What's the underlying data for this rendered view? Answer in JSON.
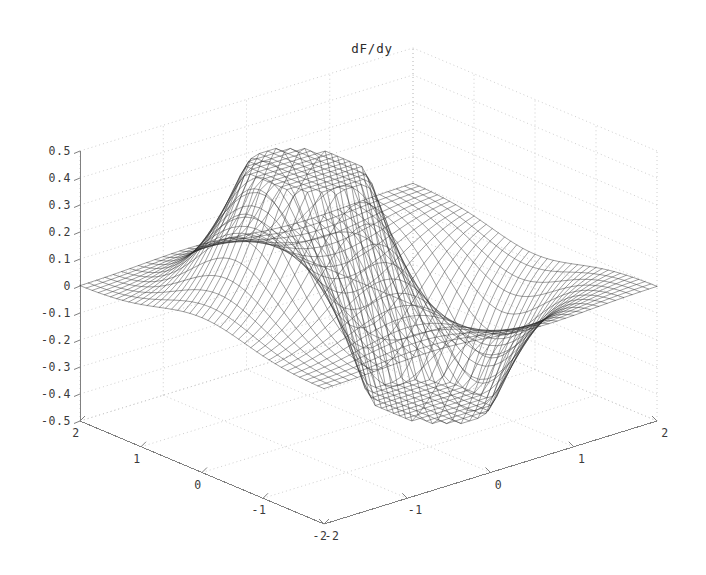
{
  "figure": {
    "title": "dF/dy",
    "background_color": "#ffffff",
    "mesh_color": "#2b2b2b",
    "axis_color": "#808080",
    "grid_color": "#c8c8c8",
    "label_color": "#3a3a3a"
  },
  "chart_data": {
    "type": "surface",
    "render_style": "wireframe-mesh",
    "title": "dF/dy",
    "xlabel": "",
    "ylabel": "",
    "zlabel": "",
    "xlim": [
      -2,
      2
    ],
    "ylim": [
      -2,
      2
    ],
    "zlim": [
      -0.5,
      0.5
    ],
    "grid": true,
    "legend": false,
    "grid_resolution": 40,
    "function_form": "dF/dy = -2*y*exp(-(x^2 + y^2))",
    "x_ticks": [
      -2,
      -1,
      0,
      1,
      2
    ],
    "x_tick_labels": [
      "-2",
      "-1",
      "0",
      "1",
      "2"
    ],
    "y_ticks": [
      -2,
      -1,
      0,
      1,
      2
    ],
    "y_tick_labels": [
      "-2",
      "-1",
      "0",
      "1",
      "2"
    ],
    "z_ticks": [
      -0.5,
      -0.4,
      -0.3,
      -0.2,
      -0.1,
      0,
      0.1,
      0.2,
      0.3,
      0.4,
      0.5
    ],
    "z_tick_labels": [
      "-0.5",
      "-0.4",
      "-0.3",
      "-0.2",
      "-0.1",
      "0",
      "0.1",
      "0.2",
      "0.3",
      "0.4",
      "0.5"
    ],
    "z_max_observed": 0.43,
    "z_min_observed": -0.43,
    "view": {
      "azimuth": -37.5,
      "elevation": 30
    },
    "axis_tick_labels": {
      "left_axis_from_top": [
        "2",
        "1",
        "0",
        "-1",
        "-2"
      ],
      "right_axis_from_bottom": [
        "-2",
        "-1",
        "0",
        "1",
        "2"
      ],
      "vertical_axis_from_top": [
        "0.5",
        "0.4",
        "0.3",
        "0.2",
        "0.1",
        "0",
        "-0.1",
        "-0.2",
        "-0.3",
        "-0.4",
        "-0.5"
      ]
    }
  }
}
